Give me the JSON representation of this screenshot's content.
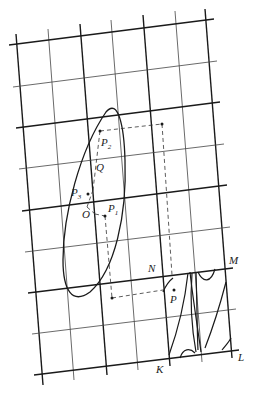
{
  "diagram": {
    "colors": {
      "line": "#1a1a1a",
      "thin_line": "#444444",
      "background": "#ffffff"
    },
    "labels": {
      "O": "O",
      "Q": "Q",
      "P1": "P",
      "P1_sub": "1",
      "P2": "P",
      "P2_sub": "2",
      "P3": "P",
      "P3_sub": "3",
      "P": "P",
      "K": "K",
      "L": "L",
      "M": "M",
      "N": "N"
    },
    "grid": {
      "vertical_lines": 7,
      "horizontal_lines": 9,
      "style": "alternating thick/thin"
    },
    "points": [
      "O",
      "Q",
      "P1",
      "P2",
      "P3",
      "P"
    ],
    "regions": [
      "ellipse around O",
      "parallelogram KLMN"
    ]
  }
}
